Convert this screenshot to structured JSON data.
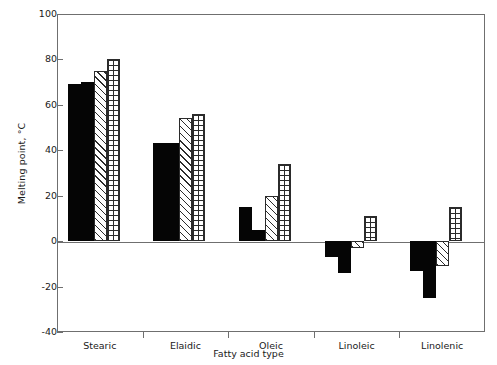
{
  "chart_data": {
    "type": "bar",
    "title": "",
    "xlabel": "Fatty acid type",
    "ylabel": "Melting point, °C",
    "categories": [
      "Stearic",
      "Elaidic",
      "Oleic",
      "Linoleic",
      "Linolenic"
    ],
    "ylim": [
      -40,
      100
    ],
    "yticks": [
      100,
      80,
      60,
      40,
      20,
      0,
      -20,
      -40
    ],
    "ytick_labels": [
      "100",
      "80",
      "60",
      "40",
      "20",
      "0",
      "-20",
      "-40"
    ],
    "grid": false,
    "legend": "none",
    "series": [
      {
        "name": "series-1",
        "fill": "solid-black",
        "values": [
          69,
          43,
          15,
          -7,
          -13
        ]
      },
      {
        "name": "series-2",
        "fill": "solid-black",
        "values": [
          70,
          43,
          5,
          -14,
          -25
        ]
      },
      {
        "name": "series-3",
        "fill": "diagonal-hatch",
        "values": [
          75,
          54,
          20,
          -3,
          -11
        ]
      },
      {
        "name": "series-4",
        "fill": "cross-hatch",
        "values": [
          80,
          56,
          34,
          11,
          15
        ]
      }
    ]
  }
}
